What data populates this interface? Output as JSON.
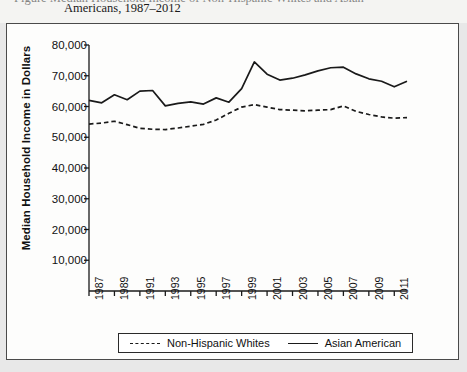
{
  "caption": {
    "line1": "Figure  Median Household Income of Non-Hispanic Whites and Asian",
    "line2": "Americans, 1987–2012"
  },
  "axis": {
    "ylabel": "Median Household Income in Dollars",
    "yticks": [
      "80,000",
      "70,000",
      "60,000",
      "50,000",
      "40,000",
      "30,000",
      "20,000",
      "10,000"
    ],
    "xticks": [
      "1987",
      "1989",
      "1991",
      "1993",
      "1995",
      "1997",
      "1999",
      "2001",
      "2003",
      "2005",
      "2007",
      "2009",
      "2011"
    ]
  },
  "legend": {
    "items": [
      {
        "label": "Non-Hispanic Whites",
        "style": "dashed"
      },
      {
        "label": "Asian American",
        "style": "solid"
      }
    ]
  },
  "colors": {
    "line": "#1a1a1a",
    "frame": "#4a4a4a",
    "plot_background": "#fdfdfc",
    "page_background": "#e8e8e8"
  },
  "chart_data": {
    "type": "line",
    "xlabel": "",
    "ylabel": "Median Household Income in Dollars",
    "ylim": [
      0,
      80000
    ],
    "xlim": [
      1987,
      2012
    ],
    "grid": false,
    "legend_position": "bottom",
    "x": [
      1987,
      1988,
      1989,
      1990,
      1991,
      1992,
      1993,
      1994,
      1995,
      1996,
      1997,
      1998,
      1999,
      2000,
      2001,
      2002,
      2003,
      2004,
      2005,
      2006,
      2007,
      2008,
      2009,
      2010,
      2011,
      2012
    ],
    "series": [
      {
        "name": "Asian American",
        "style": "solid",
        "values": [
          62000,
          61200,
          63800,
          62200,
          65000,
          65200,
          60200,
          61000,
          61500,
          60800,
          62800,
          61400,
          65800,
          74500,
          70500,
          68600,
          69200,
          70300,
          71600,
          72600,
          72800,
          70600,
          69000,
          68200,
          66400,
          68200
        ]
      },
      {
        "name": "Non-Hispanic Whites",
        "style": "dashed",
        "values": [
          54300,
          54600,
          55200,
          54100,
          52900,
          52600,
          52500,
          53000,
          53600,
          54200,
          55600,
          57800,
          59800,
          60600,
          59800,
          59000,
          58800,
          58600,
          58800,
          59000,
          60200,
          58400,
          57400,
          56600,
          56200,
          56400
        ]
      }
    ]
  }
}
